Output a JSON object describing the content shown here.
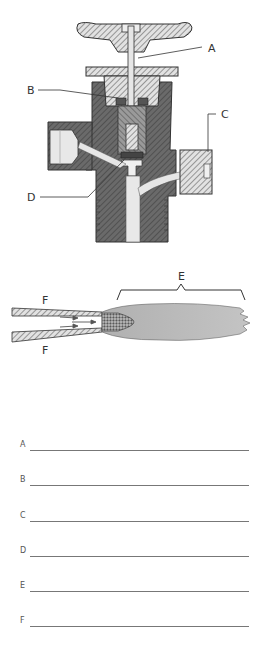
{
  "diagram": {
    "valve": {
      "callouts": [
        {
          "id": "A",
          "label": "A"
        },
        {
          "id": "B",
          "label": "B"
        },
        {
          "id": "C",
          "label": "C"
        },
        {
          "id": "D",
          "label": "D"
        }
      ]
    },
    "flame": {
      "callouts": [
        {
          "id": "E",
          "label": "E"
        },
        {
          "id": "F_top",
          "label": "F"
        },
        {
          "id": "F_bottom",
          "label": "F"
        }
      ]
    }
  },
  "answers": [
    {
      "letter": "A",
      "value": ""
    },
    {
      "letter": "B",
      "value": ""
    },
    {
      "letter": "C",
      "value": ""
    },
    {
      "letter": "D",
      "value": ""
    },
    {
      "letter": "E",
      "value": ""
    },
    {
      "letter": "F",
      "value": ""
    }
  ],
  "colors": {
    "body_dark": "#6e6e6e",
    "body_light": "#d8d8d8",
    "flame": "#b5b5b5",
    "line": "#333333"
  }
}
